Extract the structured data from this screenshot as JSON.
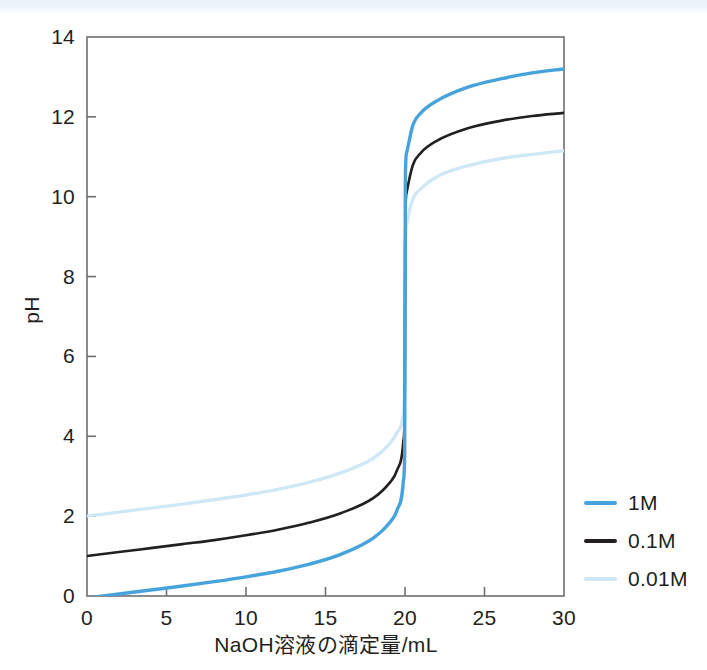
{
  "chart_data": {
    "type": "line",
    "title": "",
    "xlabel": "NaOH溶液の滴定量/mL",
    "ylabel": "pH",
    "xlim": [
      0,
      30
    ],
    "ylim": [
      0,
      14
    ],
    "xticks": [
      "0",
      "5",
      "10",
      "15",
      "20",
      "25",
      "30"
    ],
    "yticks": [
      "0",
      "2",
      "4",
      "6",
      "8",
      "10",
      "12",
      "14"
    ],
    "grid": false,
    "legend_position": "right",
    "equivalence_point_x": 20,
    "series": [
      {
        "name": "1M",
        "color": "#46a3dc",
        "x": [
          0,
          2,
          4,
          6,
          8,
          10,
          12,
          14,
          16,
          18,
          19,
          19.5,
          19.9,
          19.98,
          20,
          20.02,
          20.1,
          20.5,
          21,
          22,
          24,
          26,
          28,
          30
        ],
        "values": [
          -0.05,
          0.05,
          0.15,
          0.25,
          0.36,
          0.48,
          0.62,
          0.8,
          1.05,
          1.45,
          1.82,
          2.15,
          2.9,
          3.6,
          7.0,
          10.4,
          11.1,
          11.8,
          12.1,
          12.4,
          12.75,
          12.95,
          13.1,
          13.2
        ]
      },
      {
        "name": "0.1M",
        "color": "#231f20",
        "x": [
          0,
          2,
          4,
          6,
          8,
          10,
          12,
          14,
          16,
          18,
          19,
          19.5,
          19.9,
          19.98,
          20,
          20.02,
          20.1,
          20.5,
          21,
          22,
          24,
          26,
          28,
          30
        ],
        "values": [
          1.0,
          1.1,
          1.2,
          1.3,
          1.4,
          1.52,
          1.66,
          1.84,
          2.08,
          2.45,
          2.82,
          3.15,
          3.9,
          4.6,
          7.0,
          9.4,
          10.1,
          10.8,
          11.1,
          11.4,
          11.72,
          11.9,
          12.02,
          12.1
        ]
      },
      {
        "name": "0.01M",
        "color": "#cfe8f6",
        "x": [
          0,
          2,
          4,
          6,
          8,
          10,
          12,
          14,
          16,
          18,
          19,
          19.5,
          19.9,
          19.98,
          20,
          20.02,
          20.1,
          20.5,
          21,
          22,
          24,
          26,
          28,
          30
        ],
        "values": [
          2.0,
          2.1,
          2.2,
          2.3,
          2.41,
          2.53,
          2.67,
          2.85,
          3.09,
          3.45,
          3.8,
          4.1,
          4.6,
          5.3,
          7.0,
          8.7,
          9.3,
          9.95,
          10.2,
          10.5,
          10.78,
          10.95,
          11.06,
          11.15
        ]
      }
    ]
  },
  "legend": {
    "items": [
      {
        "label": "1M",
        "color": "#46a3dc"
      },
      {
        "label": "0.1M",
        "color": "#231f20"
      },
      {
        "label": "0.01M",
        "color": "#cfe8f6"
      }
    ]
  }
}
